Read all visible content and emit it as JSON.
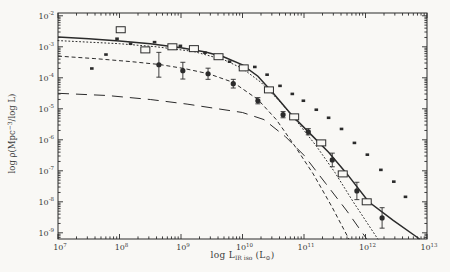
{
  "figure": {
    "paper_color": "#f9f8f5",
    "ink_color": "#2b2b2b",
    "tick_label_color": "#3a3a3a",
    "xlabel_parts": {
      "pre": "log L",
      "sub": "IR iso",
      "mid": " (L",
      "sub2": "⊙",
      "end": ")"
    },
    "ylabel_parts": {
      "pre": "log ρ(Mpc",
      "sup": "−3",
      "end": "/log L)"
    }
  },
  "chart_data": {
    "type": "scatter",
    "title": "",
    "xlabel": "log L_IR iso (L_sun)",
    "ylabel": "log rho (Mpc^-3 / log L)",
    "xscale": "log",
    "yscale": "log",
    "xlim_exp": [
      7,
      13
    ],
    "ylim_exp": [
      -9.2,
      -1.91
    ],
    "x_major_ticks_exp": [
      7,
      8,
      9,
      10,
      11,
      12,
      13
    ],
    "y_major_ticks_exp": [
      -2,
      -3,
      -4,
      -5,
      -6,
      -7,
      -8,
      -9
    ],
    "grid": false,
    "legend": "none",
    "series": [
      {
        "name": "open-squares",
        "marker": "open-square",
        "x_exp": [
          8.02,
          8.42,
          8.86,
          9.21,
          9.61,
          10.02,
          10.43,
          10.84,
          11.28,
          11.63,
          12.02
        ],
        "y_exp": [
          -2.45,
          -3.1,
          -3.0,
          -3.06,
          -3.32,
          -3.68,
          -4.39,
          -5.26,
          -6.1,
          -7.1,
          -8.0
        ]
      },
      {
        "name": "filled-circles",
        "marker": "filled-circle-errorbar",
        "x_exp": [
          8.64,
          9.03,
          9.44,
          9.85,
          10.25,
          10.66,
          11.07,
          11.46,
          11.86,
          12.27
        ],
        "y_exp": [
          -3.58,
          -3.77,
          -3.87,
          -4.19,
          -4.74,
          -5.19,
          -5.74,
          -6.65,
          -7.65,
          -8.52
        ],
        "y_err_dex": [
          0.4,
          0.27,
          0.18,
          0.14,
          0.1,
          0.1,
          0.1,
          0.22,
          0.28,
          0.33
        ]
      },
      {
        "name": "small-dots",
        "marker": "small-filled-square",
        "x_exp": [
          7.55,
          7.78,
          7.96,
          8.18,
          8.57,
          8.99,
          9.39,
          9.79,
          10.2,
          10.4,
          10.61,
          10.81,
          10.99,
          11.2,
          11.4,
          11.61,
          11.82,
          12.03,
          12.25,
          12.46,
          12.65
        ],
        "y_exp": [
          -3.7,
          -3.25,
          -2.74,
          -2.9,
          -2.85,
          -2.97,
          -3.19,
          -3.48,
          -3.65,
          -3.9,
          -4.26,
          -4.52,
          -4.74,
          -5.03,
          -5.29,
          -5.65,
          -6.1,
          -6.48,
          -6.97,
          -7.35,
          -7.84
        ]
      }
    ],
    "curves": [
      {
        "name": "solid-total",
        "style": "solid",
        "points": [
          [
            7.0,
            -2.68
          ],
          [
            7.5,
            -2.74
          ],
          [
            8.0,
            -2.81
          ],
          [
            8.5,
            -2.9
          ],
          [
            9.0,
            -3.03
          ],
          [
            9.4,
            -3.17
          ],
          [
            9.7,
            -3.33
          ],
          [
            10.0,
            -3.58
          ],
          [
            10.25,
            -3.95
          ],
          [
            10.5,
            -4.5
          ],
          [
            10.8,
            -5.2
          ],
          [
            11.1,
            -5.8
          ],
          [
            11.4,
            -6.4
          ],
          [
            11.7,
            -7.1
          ],
          [
            12.05,
            -8.0
          ],
          [
            12.45,
            -8.6
          ],
          [
            12.88,
            -9.2
          ]
        ]
      },
      {
        "name": "dotted-model",
        "style": "dotted",
        "points": [
          [
            7.0,
            -2.8
          ],
          [
            8.0,
            -2.9
          ],
          [
            8.6,
            -3.0
          ],
          [
            9.2,
            -3.15
          ],
          [
            9.7,
            -3.42
          ],
          [
            10.0,
            -3.7
          ],
          [
            10.3,
            -4.15
          ],
          [
            10.6,
            -4.75
          ],
          [
            10.9,
            -5.45
          ],
          [
            11.2,
            -6.2
          ],
          [
            11.5,
            -7.05
          ],
          [
            11.8,
            -8.0
          ],
          [
            12.2,
            -9.2
          ]
        ]
      },
      {
        "name": "short-dash-model",
        "style": "short-dash",
        "points": [
          [
            7.0,
            -3.3
          ],
          [
            7.6,
            -3.38
          ],
          [
            8.2,
            -3.48
          ],
          [
            8.65,
            -3.57
          ],
          [
            9.05,
            -3.7
          ],
          [
            9.45,
            -3.87
          ],
          [
            9.85,
            -4.15
          ],
          [
            10.25,
            -4.7
          ],
          [
            10.55,
            -5.35
          ],
          [
            10.85,
            -6.2
          ],
          [
            11.15,
            -7.1
          ],
          [
            11.45,
            -8.15
          ],
          [
            11.73,
            -9.2
          ]
        ]
      },
      {
        "name": "long-dash-model",
        "style": "long-dash",
        "points": [
          [
            7.0,
            -4.5
          ],
          [
            7.8,
            -4.57
          ],
          [
            8.5,
            -4.7
          ],
          [
            9.1,
            -4.85
          ],
          [
            9.6,
            -5.0
          ],
          [
            10.0,
            -5.12
          ],
          [
            10.35,
            -5.35
          ],
          [
            10.7,
            -5.9
          ],
          [
            11.0,
            -6.5
          ],
          [
            11.35,
            -7.4
          ],
          [
            11.7,
            -8.3
          ],
          [
            12.02,
            -9.2
          ]
        ]
      }
    ]
  }
}
